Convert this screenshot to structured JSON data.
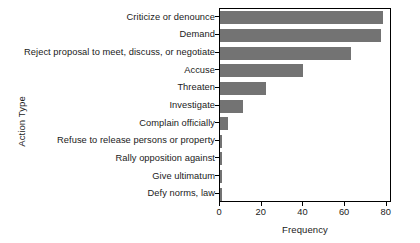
{
  "chart_data": {
    "type": "bar",
    "orientation": "horizontal",
    "title": "",
    "xlabel": "Frequency",
    "ylabel": "Action Type",
    "categories": [
      "Criticize or denounce",
      "Demand",
      "Reject proposal to meet, discuss, or negotiate",
      "Accuse",
      "Threaten",
      "Investigate",
      "Complain officially",
      "Refuse to release persons or property",
      "Rally opposition against",
      "Give ultimatum",
      "Defy norms, law"
    ],
    "values": [
      78,
      77,
      63,
      40,
      22,
      11,
      4,
      1,
      1,
      1,
      1
    ],
    "xticks": [
      0,
      20,
      40,
      60,
      80
    ],
    "xticklabels": [
      "0",
      "20",
      "40",
      "60",
      "80"
    ],
    "xlim": [
      0,
      82.5
    ],
    "grid": false,
    "legend": false,
    "bar_color": "#737373",
    "frame_color": "#000000",
    "background": "#ffffff"
  }
}
